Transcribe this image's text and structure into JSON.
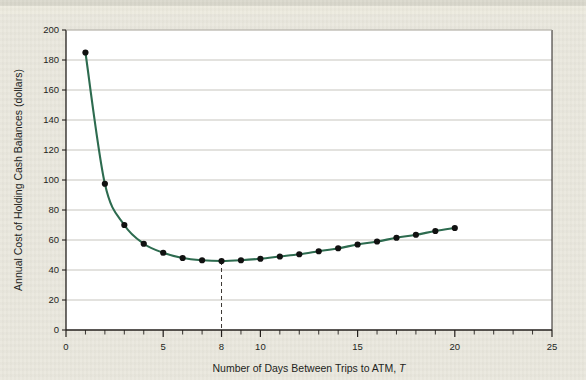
{
  "figure": {
    "background_color": "#e9e7dd",
    "plot_background_color": "#ffffff",
    "frame_color": "#231f1c"
  },
  "chart_data": {
    "type": "line",
    "title": "",
    "xlabel": "Number of Days Between Trips to ATM, T",
    "xlabel_main": "Number of Days Between Trips to ATM,",
    "xlabel_symbol": "T",
    "ylabel": "Annual Cost of Holding Cash Balances (dollars)",
    "xlim": [
      0,
      25
    ],
    "ylim": [
      0,
      200
    ],
    "xticks": [
      0,
      5,
      8,
      10,
      15,
      20,
      25
    ],
    "xtick_labels": [
      "0",
      "5",
      "8",
      "10",
      "15",
      "20",
      "25"
    ],
    "xminor_step": 1,
    "yticks": [
      0,
      20,
      40,
      60,
      80,
      100,
      120,
      140,
      160,
      180,
      200
    ],
    "ytick_labels": [
      "0",
      "20",
      "40",
      "60",
      "80",
      "100",
      "120",
      "140",
      "160",
      "180",
      "200"
    ],
    "grid": "horizontal",
    "grid_color": "#b9b6ad",
    "legend": "none",
    "series": [
      {
        "name": "Annual cost of holding cash balances",
        "line_color": "#2d6b4f",
        "marker_color": "#111111",
        "marker": "circle",
        "x": [
          1,
          2,
          3,
          4,
          5,
          6,
          7,
          8,
          9,
          10,
          11,
          12,
          13,
          14,
          15,
          16,
          17,
          18,
          19,
          20
        ],
        "y": [
          185,
          97.5,
          70,
          57.5,
          51.5,
          48,
          46.5,
          46,
          46.5,
          47.5,
          49,
          50.5,
          52.5,
          54.5,
          57,
          59,
          61.5,
          63.5,
          66,
          68
        ]
      }
    ],
    "annotations": [
      {
        "type": "dashed-vline",
        "name": "minimum-cost-marker",
        "x": 8,
        "y_from": 46,
        "y_to": 0,
        "color": "#3a3632",
        "note": "minimum total cost at T = 8 days"
      }
    ]
  }
}
